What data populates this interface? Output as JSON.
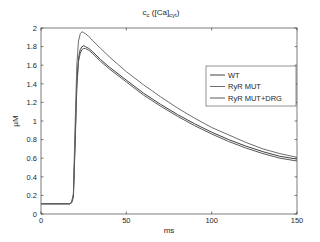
{
  "chart_data": {
    "type": "line",
    "title_main": "c",
    "title_sub1": "c",
    "title_mid": " ([Ca]",
    "title_sub2": "cyt",
    "title_end": ")",
    "xlabel": "ms",
    "ylabel": "µM",
    "xlim": [
      0,
      150
    ],
    "ylim": [
      0,
      2
    ],
    "xticks": [
      0,
      50,
      100,
      150
    ],
    "yticks": [
      0,
      0.2,
      0.4,
      0.6,
      0.8,
      1,
      1.2,
      1.4,
      1.6,
      1.8,
      2
    ],
    "ytick_labels": [
      "0",
      "0.2",
      "0.4",
      "0.6",
      "0.8",
      "1",
      "1.2",
      "1.4",
      "1.6",
      "1.8",
      "2"
    ],
    "grid": false,
    "legend_position": "upper right",
    "x": [
      0,
      17,
      18,
      19,
      20,
      21,
      22,
      23,
      24,
      25,
      26,
      28,
      30,
      35,
      40,
      50,
      60,
      70,
      80,
      90,
      100,
      110,
      120,
      130,
      140,
      150
    ],
    "series": [
      {
        "name": "WT",
        "color": "#404040",
        "values": [
          0.11,
          0.11,
          0.13,
          0.2,
          0.8,
          1.4,
          1.68,
          1.77,
          1.8,
          1.81,
          1.8,
          1.78,
          1.75,
          1.66,
          1.58,
          1.44,
          1.3,
          1.18,
          1.07,
          0.97,
          0.88,
          0.8,
          0.73,
          0.67,
          0.62,
          0.59
        ]
      },
      {
        "name": "RyR MUT",
        "color": "#6e6e6e",
        "values": [
          0.11,
          0.11,
          0.13,
          0.22,
          0.95,
          1.6,
          1.86,
          1.94,
          1.96,
          1.95,
          1.94,
          1.91,
          1.87,
          1.78,
          1.69,
          1.53,
          1.39,
          1.26,
          1.14,
          1.03,
          0.93,
          0.85,
          0.77,
          0.7,
          0.65,
          0.61
        ]
      },
      {
        "name": "RyR MUT+DRG",
        "color": "#5a5a5a",
        "values": [
          0.11,
          0.11,
          0.12,
          0.18,
          0.72,
          1.35,
          1.64,
          1.73,
          1.77,
          1.78,
          1.78,
          1.76,
          1.73,
          1.64,
          1.56,
          1.42,
          1.28,
          1.16,
          1.05,
          0.95,
          0.86,
          0.78,
          0.71,
          0.65,
          0.6,
          0.57
        ]
      }
    ]
  }
}
